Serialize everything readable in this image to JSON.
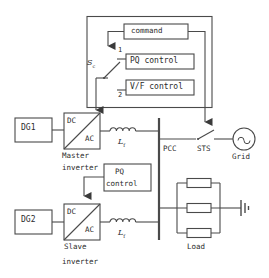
{
  "diagram": {
    "type": "single-line-electrical-diagram",
    "stroke_color": "#4a4a4a",
    "text_color": "#2b2b2b",
    "background": "#ffffff"
  },
  "control": {
    "command_label": "command",
    "pq_control_label": "PQ control",
    "vf_control_label": "V/F control",
    "switch_label": "S",
    "switch_subscript": "c",
    "position_1": "1",
    "position_2": "2"
  },
  "sources": {
    "dg1_label": "DG1",
    "dg2_label": "DG2"
  },
  "master": {
    "dc_label": "DC",
    "ac_label": "AC",
    "name_line1": "Master",
    "name_line2": "inverter",
    "inductor_symbol": "L",
    "inductor_subscript": "f"
  },
  "slave": {
    "dc_label": "DC",
    "ac_label": "AC",
    "name_line1": "Slave",
    "name_line2": "inverter",
    "inductor_symbol": "L",
    "inductor_subscript": "f",
    "pq_control_line1": "PQ",
    "pq_control_line2": "control"
  },
  "grid_side": {
    "pcc_label": "PCC",
    "sts_label": "STS",
    "grid_label": "Grid",
    "grid_source_icon": "ac-source-icon"
  },
  "load": {
    "label": "Load",
    "element_count": 3,
    "ground_icon": "ground-icon"
  }
}
